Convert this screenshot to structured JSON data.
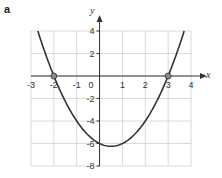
{
  "panel_label": "a",
  "chart_data": {
    "type": "line",
    "title": "",
    "function": "y = x^2 - x - 6",
    "xlabel": "x",
    "ylabel": "y",
    "xlim": [
      -3,
      4
    ],
    "ylim": [
      -8,
      4
    ],
    "grid": true,
    "x_ticks": [
      "-3",
      "-2",
      "-1",
      "1",
      "2",
      "3",
      "4"
    ],
    "y_ticks": [
      "4",
      "2",
      "-2",
      "-4",
      "-6",
      "-8"
    ],
    "origin_label": "0",
    "series": [
      {
        "name": "parabola",
        "x": [
          -2.7,
          -2,
          -1,
          0,
          0.5,
          1,
          2,
          3,
          3.7
        ],
        "y": [
          3.99,
          0,
          -4,
          -6,
          -6.25,
          -6,
          -4,
          0,
          3.99
        ]
      }
    ],
    "marked_points": [
      {
        "x": -2,
        "y": 0
      },
      {
        "x": 3,
        "y": 0
      }
    ]
  },
  "colors": {
    "grid": "#d0d0d0",
    "axis": "#333333",
    "curve": "#333333",
    "point_fill": "#888888"
  }
}
